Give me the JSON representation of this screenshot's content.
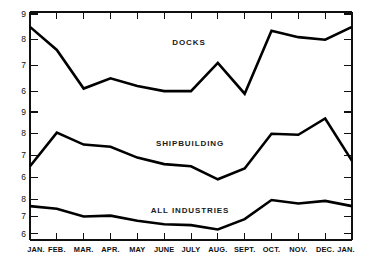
{
  "chart_data": {
    "type": "line",
    "title": "",
    "xlabel": "",
    "ylabel": "",
    "grid": false,
    "legend_position": "inline-annotation",
    "categories": [
      "JAN.",
      "FEB.",
      "MAR.",
      "APR.",
      "MAY",
      "JUNE",
      "JULY",
      "AUG.",
      "SEPT.",
      "OCT.",
      "NOV.",
      "DEC.",
      "JAN."
    ],
    "panels": [
      {
        "name": "DOCKS",
        "label": "DOCKS",
        "ylim": [
          5.5,
          9.0
        ],
        "yticks": [
          9,
          8,
          7,
          6
        ],
        "ytick_labels": [
          "9",
          "8",
          "7",
          "6"
        ],
        "values": [
          8.5,
          7.6,
          6.1,
          6.5,
          6.2,
          6.0,
          6.0,
          7.1,
          5.9,
          8.35,
          8.1,
          8.0,
          8.5
        ]
      },
      {
        "name": "SHIPBUILDING",
        "label": "SHIPBUILDING",
        "ylim": [
          5.5,
          9.0
        ],
        "yticks": [
          9,
          8,
          7,
          6
        ],
        "ytick_labels": [
          "9",
          "8",
          "7",
          "6"
        ],
        "values": [
          6.5,
          8.05,
          7.5,
          7.4,
          6.9,
          6.6,
          6.5,
          5.9,
          6.4,
          8.0,
          7.95,
          8.7,
          6.75
        ]
      },
      {
        "name": "ALL INDUSTRIES",
        "label": "ALL INDUSTRIES",
        "ylim": [
          5.7,
          8.3
        ],
        "yticks": [
          8,
          7,
          6
        ],
        "ytick_labels": [
          "8",
          "7",
          "6"
        ],
        "values": [
          7.6,
          7.45,
          7.0,
          7.05,
          6.75,
          6.55,
          6.5,
          6.25,
          6.85,
          7.95,
          7.75,
          7.9,
          7.6
        ]
      }
    ]
  },
  "annotations": {
    "docks_label": "DOCKS",
    "shipbuilding_label": "SHIPBUILDING",
    "all_industries_label": "ALL INDUSTRIES"
  },
  "colors": {
    "line": "#000000",
    "axis": "#101010",
    "background": "#ffffff"
  }
}
